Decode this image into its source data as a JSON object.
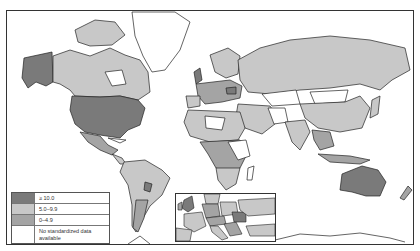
{
  "map": {
    "type": "choropleth world map",
    "projection": "Mercator",
    "colors": {
      "high": "#7a7a7a",
      "mid": "#c8c8c8",
      "low": "#a4a4a4",
      "none": "#ffffff",
      "border": "#222222"
    }
  },
  "legend": {
    "items": [
      {
        "label": "≥ 10.0",
        "color": "#7a7a7a"
      },
      {
        "label": "5.0–9.9",
        "color": "#c8c8c8"
      },
      {
        "label": "0–4.9",
        "color": "#a4a4a4"
      },
      {
        "label": "No standardized data available",
        "color": "#ffffff"
      }
    ]
  },
  "inset": {
    "region": "Europe"
  },
  "regions": {
    "high": [
      "United States",
      "Alaska",
      "Australia",
      "United Kingdom",
      "Romania"
    ],
    "mid": [
      "Canada",
      "Russia",
      "China",
      "Brazil",
      "India",
      "Argentina",
      "Scandinavia",
      "Western Europe"
    ],
    "none": [
      "Greenland",
      "Mongolia",
      "Kazakhstan",
      "Hudson Bay area",
      "parts of Africa",
      "Antarctica"
    ]
  }
}
